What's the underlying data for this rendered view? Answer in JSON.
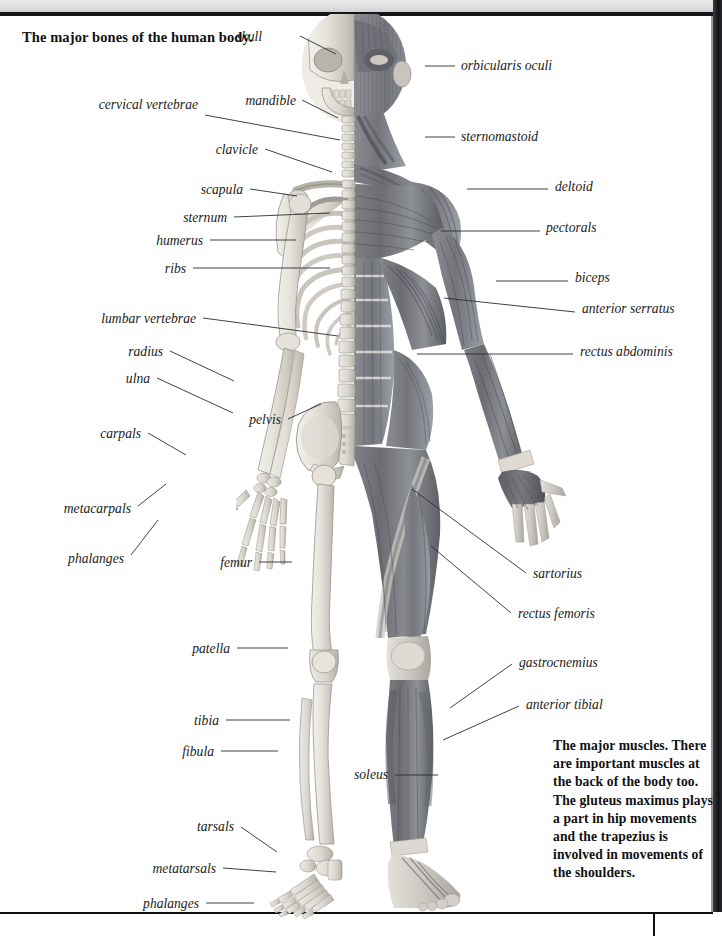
{
  "page": {
    "background": "#ffffff",
    "ink": "#1b1c20",
    "rule_color": "#0d0e11",
    "folio": ""
  },
  "captions": {
    "bones": "The major bones of the human body.",
    "muscles": "The major muscles. There are important muscles at the back of the body too. The gluteus maximus plays a part in hip movements and the trapezius is involved in movements of the shoulders."
  },
  "bone_labels": [
    {
      "id": "skull",
      "text": "skull",
      "x": 262,
      "y": 40,
      "align": "right",
      "lx1": 300,
      "ly1": 36,
      "lx2": 336,
      "ly2": 54
    },
    {
      "id": "mandible",
      "text": "mandible",
      "x": 296,
      "y": 104,
      "align": "right",
      "lx1": 302,
      "ly1": 100,
      "lx2": 338,
      "ly2": 118
    },
    {
      "id": "cervical-vertebrae",
      "text": "cervical vertebrae",
      "x": 198,
      "y": 108,
      "align": "right",
      "lx1": 205,
      "ly1": 115,
      "lx2": 340,
      "ly2": 140,
      "multiline": true
    },
    {
      "id": "clavicle",
      "text": "clavicle",
      "x": 258,
      "y": 153,
      "align": "right",
      "lx1": 265,
      "ly1": 149,
      "lx2": 332,
      "ly2": 172
    },
    {
      "id": "scapula",
      "text": "scapula",
      "x": 243,
      "y": 193,
      "align": "right",
      "lx1": 250,
      "ly1": 189,
      "lx2": 297,
      "ly2": 196
    },
    {
      "id": "sternum",
      "text": "sternum",
      "x": 227,
      "y": 221,
      "align": "right",
      "lx1": 234,
      "ly1": 217,
      "lx2": 330,
      "ly2": 213
    },
    {
      "id": "humerus",
      "text": "humerus",
      "x": 203,
      "y": 244,
      "align": "right",
      "lx1": 210,
      "ly1": 240,
      "lx2": 296,
      "ly2": 240
    },
    {
      "id": "ribs",
      "text": "ribs",
      "x": 186,
      "y": 272,
      "align": "right",
      "lx1": 193,
      "ly1": 268,
      "lx2": 330,
      "ly2": 268
    },
    {
      "id": "lumbar-vertebrae",
      "text": "lumbar vertebrae",
      "x": 196,
      "y": 322,
      "align": "right",
      "lx1": 203,
      "ly1": 318,
      "lx2": 338,
      "ly2": 336
    },
    {
      "id": "radius",
      "text": "radius",
      "x": 163,
      "y": 355,
      "align": "right",
      "lx1": 170,
      "ly1": 351,
      "lx2": 234,
      "ly2": 381
    },
    {
      "id": "ulna",
      "text": "ulna",
      "x": 150,
      "y": 382,
      "align": "right",
      "lx1": 157,
      "ly1": 378,
      "lx2": 233,
      "ly2": 413
    },
    {
      "id": "pelvis",
      "text": "pelvis",
      "x": 281,
      "y": 423,
      "align": "right",
      "lx1": 288,
      "ly1": 419,
      "lx2": 321,
      "ly2": 404
    },
    {
      "id": "carpals",
      "text": "carpals",
      "x": 141,
      "y": 437,
      "align": "right",
      "lx1": 148,
      "ly1": 433,
      "lx2": 186,
      "ly2": 455
    },
    {
      "id": "metacarpals",
      "text": "metacarpals",
      "x": 131,
      "y": 512,
      "align": "right",
      "lx1": 138,
      "ly1": 506,
      "lx2": 166,
      "ly2": 484
    },
    {
      "id": "phalanges-hand",
      "text": "phalanges",
      "x": 124,
      "y": 562,
      "align": "right",
      "lx1": 131,
      "ly1": 555,
      "lx2": 158,
      "ly2": 520
    },
    {
      "id": "femur",
      "text": "femur",
      "x": 252,
      "y": 566,
      "align": "right",
      "lx1": 259,
      "ly1": 562,
      "lx2": 292,
      "ly2": 562
    },
    {
      "id": "patella",
      "text": "patella",
      "x": 230,
      "y": 652,
      "align": "right",
      "lx1": 237,
      "ly1": 648,
      "lx2": 288,
      "ly2": 648
    },
    {
      "id": "tibia",
      "text": "tibia",
      "x": 219,
      "y": 724,
      "align": "right",
      "lx1": 226,
      "ly1": 720,
      "lx2": 290,
      "ly2": 720
    },
    {
      "id": "fibula",
      "text": "fibula",
      "x": 214,
      "y": 755,
      "align": "right",
      "lx1": 221,
      "ly1": 751,
      "lx2": 278,
      "ly2": 751
    },
    {
      "id": "tarsals",
      "text": "tarsals",
      "x": 234,
      "y": 830,
      "align": "right",
      "lx1": 241,
      "ly1": 827,
      "lx2": 277,
      "ly2": 852
    },
    {
      "id": "metatarsals",
      "text": "metatarsals",
      "x": 216,
      "y": 872,
      "align": "right",
      "lx1": 223,
      "ly1": 868,
      "lx2": 276,
      "ly2": 872
    },
    {
      "id": "phalanges-foot",
      "text": "phalanges",
      "x": 199,
      "y": 907,
      "align": "right",
      "lx1": 206,
      "ly1": 903,
      "lx2": 254,
      "ly2": 903
    }
  ],
  "muscle_labels": [
    {
      "id": "orbicularis-oculi",
      "text": "orbicularis oculi",
      "x": 461,
      "y": 69,
      "align": "left",
      "lx1": 425,
      "ly1": 66,
      "lx2": 455,
      "ly2": 66
    },
    {
      "id": "sternomastoid",
      "text": "sternomastoid",
      "x": 461,
      "y": 140,
      "align": "left",
      "lx1": 425,
      "ly1": 137,
      "lx2": 455,
      "ly2": 137
    },
    {
      "id": "deltoid",
      "text": "deltoid",
      "x": 555,
      "y": 190,
      "align": "left",
      "lx1": 467,
      "ly1": 189,
      "lx2": 548,
      "ly2": 189
    },
    {
      "id": "pectorals",
      "text": "pectorals",
      "x": 546,
      "y": 231,
      "align": "left",
      "lx1": 441,
      "ly1": 231,
      "lx2": 540,
      "ly2": 231
    },
    {
      "id": "biceps",
      "text": "biceps",
      "x": 575,
      "y": 281,
      "align": "left",
      "lx1": 496,
      "ly1": 281,
      "lx2": 568,
      "ly2": 281
    },
    {
      "id": "anterior-serratus",
      "text": "anterior serratus",
      "x": 582,
      "y": 312,
      "align": "left",
      "lx1": 444,
      "ly1": 298,
      "lx2": 575,
      "ly2": 312
    },
    {
      "id": "rectus-abdominis",
      "text": "rectus abdominis",
      "x": 580,
      "y": 355,
      "align": "left",
      "lx1": 417,
      "ly1": 354,
      "lx2": 573,
      "ly2": 354
    },
    {
      "id": "sartorius",
      "text": "sartorius",
      "x": 533,
      "y": 577,
      "align": "left",
      "lx1": 412,
      "ly1": 489,
      "lx2": 526,
      "ly2": 573
    },
    {
      "id": "rectus-femoris",
      "text": "rectus femoris",
      "x": 518,
      "y": 617,
      "align": "left",
      "lx1": 431,
      "ly1": 546,
      "lx2": 511,
      "ly2": 613
    },
    {
      "id": "gastrocnemius",
      "text": "gastrocnemius",
      "x": 519,
      "y": 666,
      "align": "left",
      "lx1": 450,
      "ly1": 708,
      "lx2": 512,
      "ly2": 664
    },
    {
      "id": "anterior-tibial",
      "text": "anterior tibial",
      "x": 526,
      "y": 708,
      "align": "left",
      "lx1": 443,
      "ly1": 740,
      "lx2": 519,
      "ly2": 706
    },
    {
      "id": "soleus",
      "text": "soleus",
      "x": 388,
      "y": 778,
      "align": "right",
      "lx1": 395,
      "ly1": 775,
      "lx2": 438,
      "ly2": 775
    }
  ]
}
